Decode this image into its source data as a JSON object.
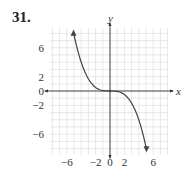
{
  "problem_number": "31.",
  "chart_data": {
    "type": "line",
    "title": "",
    "xlabel": "x",
    "ylabel": "y",
    "xlim": [
      -8,
      8
    ],
    "ylim": [
      -8.7,
      8.7
    ],
    "grid": true,
    "x_ticks": [
      "−6",
      "−2",
      "0",
      "2",
      "6"
    ],
    "x_tick_values": [
      -6,
      -2,
      0,
      2,
      6
    ],
    "y_ticks": [
      "6",
      "2",
      "0",
      "−2",
      "−6"
    ],
    "y_tick_values": [
      6,
      2,
      0,
      -2,
      -6
    ],
    "series": [
      {
        "name": "f(x)",
        "description": "decreasing cubic-like curve through origin, arrows at both ends",
        "x": [
          -5,
          -4,
          -3,
          -2,
          -1,
          0,
          1,
          2,
          3,
          4,
          5
        ],
        "y": [
          7.8,
          4,
          1.7,
          0.5,
          0.06,
          0,
          -0.06,
          -0.5,
          -1.7,
          -4,
          -7.8
        ]
      }
    ],
    "colors": {
      "curve": "#444444",
      "grid": "#d8d8d8",
      "axis": "#333333"
    }
  }
}
